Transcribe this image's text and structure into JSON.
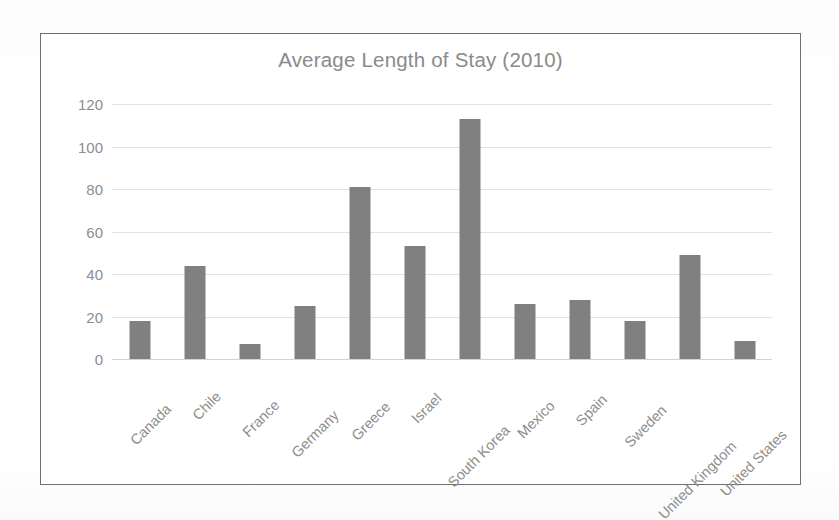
{
  "chart_data": {
    "type": "bar",
    "title": "Average Length of Stay (2010)",
    "xlabel": "",
    "ylabel": "",
    "ylim": [
      0,
      120
    ],
    "ytick_values": [
      0,
      20,
      40,
      60,
      80,
      100,
      120
    ],
    "ytick_labels": [
      "0",
      "20",
      "40",
      "60",
      "80",
      "100",
      "120"
    ],
    "grid": true,
    "legend": "none",
    "bar_color": "#808080",
    "categories": [
      "Canada",
      "Chile",
      "France",
      "Germany",
      "Greece",
      "Israel",
      "South Korea",
      "Mexico",
      "Spain",
      "Sweden",
      "United Kingdom",
      "United States"
    ],
    "values": [
      18,
      44,
      7,
      25,
      81,
      53,
      113,
      26,
      28,
      18,
      49,
      8.5
    ]
  },
  "style": {
    "title_color": "#8a8a8a",
    "tick_color": "#8d8d8d",
    "grid_color": "#e2e2e2",
    "frame_color": "#6f6f6f",
    "background": "#ffffff"
  }
}
